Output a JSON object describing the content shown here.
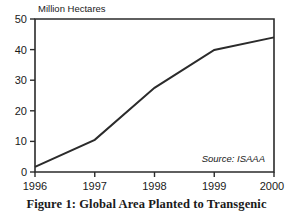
{
  "chart_data": {
    "type": "line",
    "title": "",
    "xlabel": "",
    "ylabel": "Million Hectares",
    "x": [
      1996,
      1997,
      1998,
      1999,
      2000
    ],
    "categories": [
      "1996",
      "1997",
      "1998",
      "1999",
      "2000"
    ],
    "values": [
      1.7,
      10.5,
      27.5,
      39.9,
      44.0
    ],
    "series": [
      {
        "name": "Global area planted to transgenic crops",
        "values": [
          1.7,
          10.5,
          27.5,
          39.9,
          44.0
        ]
      }
    ],
    "xlim": [
      1996,
      2000
    ],
    "ylim": [
      0,
      50
    ],
    "y_ticks": [
      0,
      10,
      20,
      30,
      40,
      50
    ],
    "y_tick_labels": [
      "0",
      "10",
      "20",
      "30",
      "40",
      "50"
    ],
    "x_ticks": [
      1996,
      1997,
      1998,
      1999,
      2000
    ],
    "x_tick_labels": [
      "1996",
      "1997",
      "1998",
      "1999",
      "2000"
    ],
    "grid": false,
    "legend": "none",
    "annotations": [
      {
        "text": "Source:  ISAAA",
        "position": "bottom-right-inside"
      }
    ],
    "line_color": "#2b2b2b",
    "frame_color": "#2b2b2b",
    "background_color": "#ffffff"
  },
  "figure": {
    "caption": "Figure 1: Global Area Planted to Transgenic",
    "y_axis_title": "Million Hectares",
    "source_note": "Source:  ISAAA"
  }
}
